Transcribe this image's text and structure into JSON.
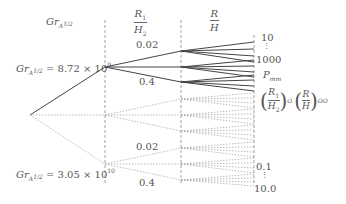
{
  "headers": {
    "col1": {
      "base": "Gr",
      "sub": "A",
      "sup": "1/2"
    },
    "col2": {
      "num": "R",
      "num_sub": "1",
      "den": "H",
      "den_sub": "2"
    },
    "col3": {
      "num": "R",
      "den": "H"
    }
  },
  "branches": {
    "upper": {
      "base": "Gr",
      "sub": "A",
      "sup": "1/2",
      "value": " = 8.72 × 10",
      "exp": "9"
    },
    "lower": {
      "base": "Gr",
      "sub": "A",
      "sup": "1/2",
      "value": " = 3.05 × 10",
      "exp": "10"
    }
  },
  "ratio_labels": {
    "upper_top": "0.02",
    "upper_bottom": "0.4",
    "lower_top": "0.02",
    "lower_bottom": "0.4"
  },
  "outputs": {
    "range_top": "10",
    "dots_top": "⋮",
    "range_bottom": "1000",
    "p_label": "P",
    "p_sub": "mm",
    "opt_ratio1": {
      "num": "R",
      "num_sub": "1",
      "den": "H",
      "den_sub": "2",
      "sub": "O"
    },
    "opt_ratio2": {
      "num": "R",
      "den": "H",
      "sub": "OO"
    },
    "lower_range_top": "0.1",
    "dots_lower": "⋮",
    "lower_range_bottom": "10.0"
  }
}
